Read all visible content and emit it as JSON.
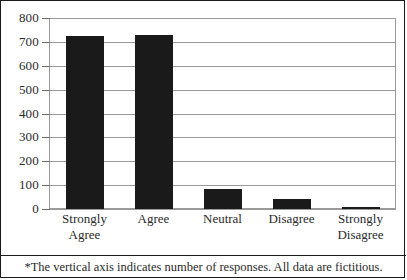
{
  "chart_data": {
    "type": "bar",
    "title": "",
    "subtitle": "",
    "xlabel": "",
    "ylabel": "",
    "categories": [
      "Strongly Agree",
      "Agree",
      "Neutral",
      "Disagree",
      "Strongly Disagree"
    ],
    "category_lines": [
      [
        "Strongly",
        "Agree"
      ],
      [
        "Agree"
      ],
      [
        "Neutral"
      ],
      [
        "Disagree"
      ],
      [
        "Strongly",
        "Disagree"
      ]
    ],
    "values": [
      725,
      730,
      85,
      40,
      8
    ],
    "ylim": [
      0,
      800
    ],
    "ytick_values": [
      0,
      100,
      200,
      300,
      400,
      500,
      600,
      700,
      800
    ],
    "ytick_labels": [
      "0",
      "100",
      "200",
      "300",
      "400",
      "500",
      "600",
      "700",
      "800"
    ],
    "grid": true,
    "legend": "none",
    "bar_color": "#1a1a1a",
    "grid_color": "#9a9a9a",
    "axis_color": "#9a9a9a",
    "border_color": "#1a1a1a"
  },
  "footnote": {
    "text": "*The vertical axis indicates number of responses. All data are fictitious."
  }
}
